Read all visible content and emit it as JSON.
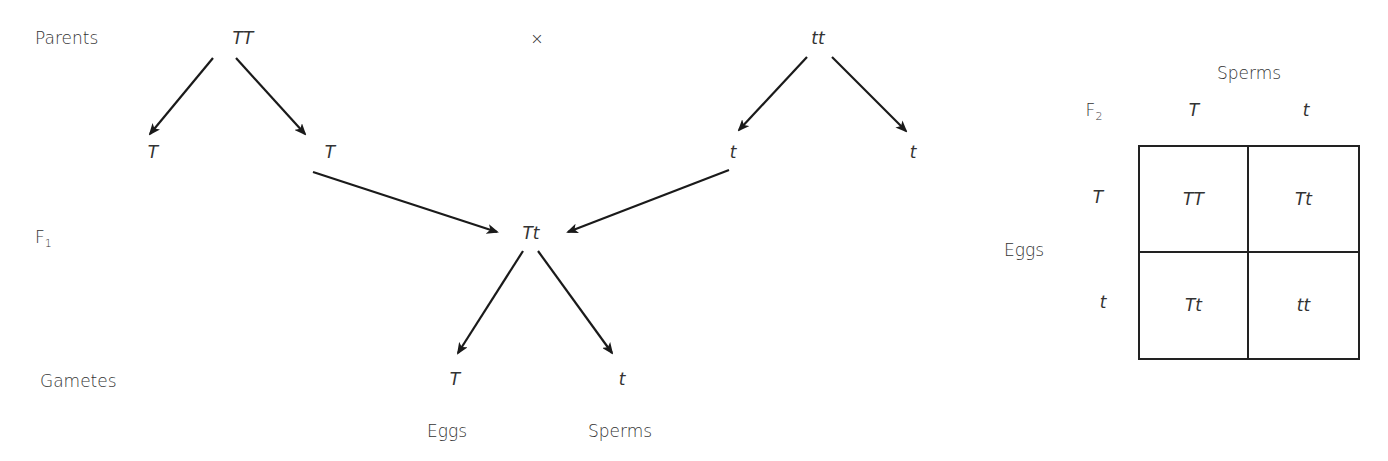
{
  "cross": {
    "row_labels": {
      "parents": "Parents",
      "f1_base": "F",
      "f1_sub": "1",
      "gametes": "Gametes"
    },
    "parent1": "TT",
    "cross_symbol": "×",
    "parent2": "tt",
    "parent1_gametes": [
      "T",
      "T"
    ],
    "parent2_gametes": [
      "t",
      "t"
    ],
    "f1": "Tt",
    "f1_gametes": [
      "T",
      "t"
    ],
    "gamete_labels": [
      "Eggs",
      "Sperms"
    ]
  },
  "punnett": {
    "title_base": "F",
    "title_sub": "2",
    "column_header": "Sperms",
    "row_header": "Eggs",
    "columns": [
      "T",
      "t"
    ],
    "rows": [
      "T",
      "t"
    ],
    "cells": [
      [
        "TT",
        "Tt"
      ],
      [
        "Tt",
        "tt"
      ]
    ]
  }
}
